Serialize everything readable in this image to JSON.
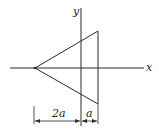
{
  "figure": {
    "axes": {
      "x_label": "x",
      "y_label": "y"
    },
    "shape": "triangle",
    "dimensions": [
      {
        "label": "2a",
        "from": "apex",
        "to": "y-axis"
      },
      {
        "label": "a",
        "from": "y-axis",
        "to": "right-edge"
      }
    ],
    "colors": {
      "line": "#2a2a2a",
      "background": "#ffffff"
    }
  }
}
